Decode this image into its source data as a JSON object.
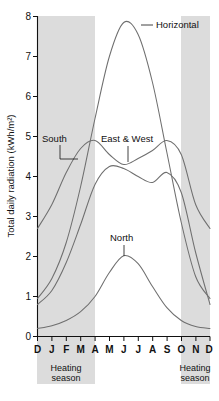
{
  "chart_data": {
    "type": "line",
    "title": "",
    "xlabel": "",
    "ylabel": "Total daily radiation (kWh/m²)",
    "ylim": [
      0,
      8
    ],
    "yticks": [
      0,
      1,
      2,
      3,
      4,
      5,
      6,
      7,
      8
    ],
    "ytick_labels": [
      "0",
      "1",
      "2",
      "3",
      "4",
      "5",
      "6",
      "7",
      "8"
    ],
    "categories": [
      "D",
      "J",
      "F",
      "M",
      "A",
      "M",
      "J",
      "J",
      "A",
      "S",
      "O",
      "N",
      "D"
    ],
    "x_tick_labels": [
      "D",
      "J",
      "F",
      "M",
      "A",
      "M",
      "J",
      "J",
      "A",
      "S",
      "O",
      "N",
      "D"
    ],
    "grid": false,
    "legend_position": "inline-annotations",
    "series": [
      {
        "name": "Horizontal",
        "label": "Horizontal",
        "values": [
          0.95,
          1.45,
          2.35,
          3.75,
          5.45,
          7.0,
          7.85,
          7.55,
          6.35,
          4.6,
          2.85,
          1.5,
          0.95
        ]
      },
      {
        "name": "South",
        "label": "South",
        "values": [
          2.7,
          3.3,
          4.1,
          4.7,
          4.9,
          4.55,
          4.3,
          4.45,
          4.65,
          4.9,
          4.55,
          3.3,
          2.7
        ]
      },
      {
        "name": "East & West",
        "label": "East & West",
        "values": [
          0.8,
          1.15,
          1.85,
          2.8,
          3.8,
          4.25,
          4.2,
          4.0,
          3.85,
          4.1,
          3.6,
          2.1,
          0.8
        ]
      },
      {
        "name": "North",
        "label": "North",
        "values": [
          0.2,
          0.27,
          0.4,
          0.62,
          1.0,
          1.6,
          2.02,
          1.82,
          1.25,
          0.72,
          0.4,
          0.25,
          0.2
        ]
      }
    ],
    "annotations": [
      {
        "text": "Horizontal",
        "series": "Horizontal",
        "x": 7.2,
        "y": 7.7
      },
      {
        "text": "South",
        "series": "South",
        "x": 1.4,
        "y": 4.85
      },
      {
        "text": "East & West",
        "series": "East & West",
        "x": 6.3,
        "y": 4.85
      },
      {
        "text": "North",
        "series": "North",
        "x": 6.0,
        "y": 2.55
      }
    ],
    "shaded_regions": [
      {
        "label": "Heating\nseason",
        "label_line1": "Heating",
        "label_line2": "season",
        "x_start": "D",
        "x_end": "A",
        "color": "#dcdcdc"
      },
      {
        "label": "Heating\nseason",
        "label_line1": "Heating",
        "label_line2": "season",
        "x_start": "O",
        "x_end": "D",
        "color": "#dcdcdc"
      }
    ]
  },
  "labels": {
    "y_axis_title": "Total daily radiation (kWh/m²)",
    "horizontal": "Horizontal",
    "south": "South",
    "east_and_west": "East & West",
    "north": "North",
    "heating_left_line1": "Heating",
    "heating_left_line2": "season",
    "heating_right_line1": "Heating",
    "heating_right_line2": "season",
    "ytick_0": "0",
    "ytick_1": "1",
    "ytick_2": "2",
    "ytick_3": "3",
    "ytick_4": "4",
    "ytick_5": "5",
    "ytick_6": "6",
    "ytick_7": "7",
    "ytick_8": "8",
    "xtick_0": "D",
    "xtick_1": "J",
    "xtick_2": "F",
    "xtick_3": "M",
    "xtick_4": "A",
    "xtick_5": "M",
    "xtick_6": "J",
    "xtick_7": "J",
    "xtick_8": "A",
    "xtick_9": "S",
    "xtick_10": "O",
    "xtick_11": "N",
    "xtick_12": "D"
  },
  "colors": {
    "curve": "#6f6f6f",
    "band": "#dcdcdc",
    "axis": "#111111",
    "background": "#ffffff"
  }
}
